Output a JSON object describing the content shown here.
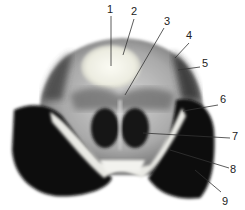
{
  "figure": {
    "type": "anatomical cross-section photograph (grayscale)",
    "labels": [
      {
        "n": "1",
        "x": 107,
        "y": 4,
        "lx1": 111,
        "ly1": 16,
        "lx2": 111,
        "ly2": 66
      },
      {
        "n": "2",
        "x": 131,
        "y": 6,
        "lx1": 134,
        "ly1": 19,
        "lx2": 123,
        "ly2": 55
      },
      {
        "n": "3",
        "x": 164,
        "y": 16,
        "lx1": 164,
        "ly1": 28,
        "lx2": 125,
        "ly2": 95
      },
      {
        "n": "4",
        "x": 186,
        "y": 30,
        "lx1": 189,
        "ly1": 43,
        "lx2": 175,
        "ly2": 58
      },
      {
        "n": "5",
        "x": 202,
        "y": 58,
        "lx1": 200,
        "ly1": 67,
        "lx2": 178,
        "ly2": 70
      },
      {
        "n": "6",
        "x": 220,
        "y": 94,
        "lx1": 218,
        "ly1": 105,
        "lx2": 183,
        "ly2": 111
      },
      {
        "n": "7",
        "x": 232,
        "y": 131,
        "lx1": 230,
        "ly1": 138,
        "lx2": 143,
        "ly2": 133
      },
      {
        "n": "8",
        "x": 230,
        "y": 164,
        "lx1": 229,
        "ly1": 168,
        "lx2": 170,
        "ly2": 150
      },
      {
        "n": "9",
        "x": 222,
        "y": 196,
        "lx1": 221,
        "ly1": 192,
        "lx2": 195,
        "ly2": 170
      }
    ]
  }
}
